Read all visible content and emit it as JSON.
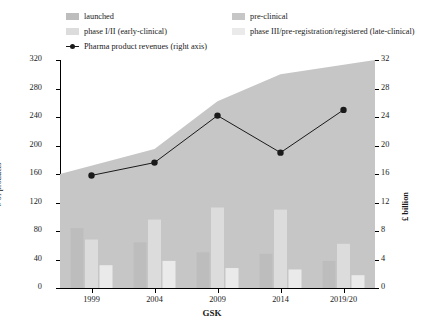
{
  "legend": {
    "left_items": [
      {
        "label": "launched",
        "type": "swatch",
        "color": "#bdbdbd",
        "name": "legend-launched"
      },
      {
        "label": "phase I/II (early-clinical)",
        "type": "swatch",
        "color": "#dcdcdc",
        "name": "legend-phase-1-2"
      },
      {
        "label": "Pharma product revenues (right axis)",
        "type": "line-marker",
        "color": "#1a1a1a",
        "name": "legend-revenues"
      }
    ],
    "right_items": [
      {
        "label": "pre-clinical",
        "type": "swatch",
        "color": "#c6c6c6",
        "name": "legend-pre-clinical"
      },
      {
        "label": "phase III/pre-registration/registered (late-clinical)",
        "type": "swatch",
        "color": "#eaeaea",
        "name": "legend-phase-3"
      }
    ]
  },
  "chart_data": {
    "type": "bar",
    "title": "",
    "xlabel": "GSK",
    "ylabel": "# of products",
    "y2label": "£ billion",
    "categories": [
      "1999",
      "2004",
      "2009",
      "2014",
      "2019/20"
    ],
    "ylim": [
      0,
      320
    ],
    "yticks": [
      0,
      40,
      80,
      120,
      160,
      200,
      240,
      280,
      320
    ],
    "y2lim": [
      0,
      32
    ],
    "y2ticks": [
      0,
      4,
      8,
      12,
      16,
      20,
      24,
      28,
      32
    ],
    "grid": false,
    "legend_position": "top",
    "series": [
      {
        "name": "pre-clinical",
        "kind": "area",
        "color": "#c6c6c6",
        "axis": "left",
        "values": [
          160,
          195,
          262,
          300,
          320
        ]
      },
      {
        "name": "launched",
        "kind": "bar",
        "color": "#bdbdbd",
        "axis": "left",
        "values": [
          84,
          64,
          50,
          48,
          38
        ]
      },
      {
        "name": "phase I/II (early-clinical)",
        "kind": "bar",
        "color": "#dcdcdc",
        "axis": "left",
        "values": [
          68,
          96,
          113,
          110,
          62
        ]
      },
      {
        "name": "phase III/pre-registration/registered (late-clinical)",
        "kind": "bar",
        "color": "#eaeaea",
        "axis": "left",
        "values": [
          32,
          38,
          28,
          26,
          18
        ]
      },
      {
        "name": "Pharma product revenues (right axis)",
        "kind": "line",
        "color": "#1a1a1a",
        "axis": "right",
        "values": [
          15.8,
          17.6,
          24.2,
          19.0,
          25.0
        ]
      }
    ]
  }
}
